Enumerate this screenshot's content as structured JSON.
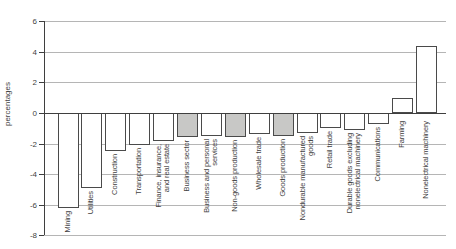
{
  "chart_data": {
    "type": "bar",
    "title": "",
    "xlabel": "",
    "ylabel": "percentages",
    "ylim": [
      -8,
      6
    ],
    "yticks": [
      6,
      4,
      2,
      0,
      -2,
      -4,
      -6,
      -8
    ],
    "grid": true,
    "legend": "none",
    "categories": [
      "Mining",
      "Utilities",
      "Construction",
      "Transportation",
      "Finance, insurance, and real estate",
      "Business sector",
      "Business and personal services",
      "Non-goods production",
      "Wholesale trade",
      "Goods production",
      "Nondurable manufactured goods",
      "Retail trade",
      "Durable goods excluding nonelectrical machinery",
      "Communications",
      "Farming",
      "Nonelectrical machinery"
    ],
    "category_display_lines": [
      [
        "Mining"
      ],
      [
        "Utilities"
      ],
      [
        "Construction"
      ],
      [
        "Transportation"
      ],
      [
        "Finance, insurance,",
        "and real estate"
      ],
      [
        "Business sector"
      ],
      [
        "Business and personal",
        "services"
      ],
      [
        "Non-goods production"
      ],
      [
        "Wholesale trade"
      ],
      [
        "Goods production"
      ],
      [
        "Nondurable manufactured",
        "goods"
      ],
      [
        "Retail trade"
      ],
      [
        "Durable goods excluding",
        "nonelectrical machinery"
      ],
      [
        "Communications"
      ],
      [
        "Farming"
      ],
      [
        "Nonelectrical machinery"
      ]
    ],
    "values": [
      -6.2,
      -4.9,
      -2.5,
      -2.1,
      -1.8,
      -1.6,
      -1.5,
      -1.6,
      -1.4,
      -1.5,
      -1.3,
      -1.0,
      -1.1,
      -0.7,
      1.0,
      4.4
    ],
    "gray_indices": [
      5,
      7,
      9
    ],
    "colors": {
      "bar_fill": "#ffffff",
      "bar_gray_fill": "#c8c8c6",
      "bar_border": "#4a4a4a",
      "gridline": "#b5b5b5",
      "axis": "#3f3f3f",
      "text": "#3f3f3f"
    }
  }
}
